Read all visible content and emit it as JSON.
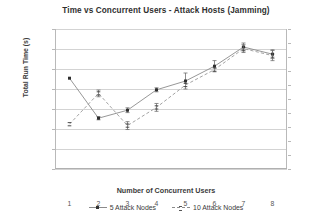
{
  "chart_data": {
    "type": "line",
    "title": "Time vs Concurrent Users - Attack Hosts (Jamming)",
    "xlabel": "Number of Concurrent Users",
    "ylabel": "Total Run Time (s)",
    "ylabel_right": "",
    "categories": [
      1,
      2,
      3,
      4,
      5,
      6,
      7,
      8
    ],
    "x": [
      1,
      2,
      3,
      4,
      5,
      6,
      7,
      8
    ],
    "ylim": [
      2200,
      2550
    ],
    "ytick_step": 50,
    "yticks_left": [
      2550,
      2500,
      2450,
      2400,
      2350,
      2300,
      2250,
      2200
    ],
    "ylim_right": [
      3050,
      3550
    ],
    "yticks_right": [
      3550,
      3500,
      3450,
      3400,
      3350,
      3300,
      3250,
      3200,
      3150,
      3100,
      3050
    ],
    "grid": true,
    "legend_position": "bottom",
    "series": [
      {
        "name": "5 Attack Nodes",
        "axis": "left",
        "style": "solid",
        "marker": "square",
        "values": [
          2427,
          2327,
          2347,
          2398,
          2420,
          2457,
          2505,
          2487
        ],
        "errors": [
          0,
          4,
          6,
          5,
          20,
          14,
          10,
          11
        ]
      },
      {
        "name": "10 Attack Nodes",
        "axis": "right",
        "style": "dashed",
        "marker": "dash",
        "values": [
          3210,
          3320,
          3205,
          3270,
          3350,
          3405,
          3480,
          3455
        ],
        "errors": [
          0,
          12,
          14,
          14,
          0,
          0,
          14,
          18
        ]
      }
    ]
  },
  "colors": {
    "series_5_nodes": "#8b8b8b",
    "series_10_nodes": "#9a9a9a",
    "marker": "#2e2e2e",
    "grid": "#d3d3d3",
    "axis": "#b9b9b9",
    "text": "#3b3b3b"
  }
}
